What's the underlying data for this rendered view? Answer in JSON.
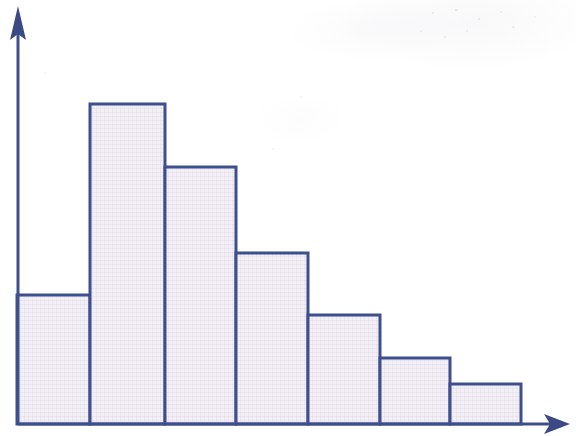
{
  "figure": {
    "title": "",
    "background_color": "#ffffff",
    "width": 576,
    "height": 436
  },
  "axes": {
    "y_axis": {
      "label": "",
      "color": "#3e4f8e",
      "arrow": "up-arrow",
      "line_width": 3,
      "x": 18,
      "top_y": 8,
      "bottom_y": 425,
      "tick_labels": []
    },
    "x_axis": {
      "label": "",
      "color": "#3e4f8e",
      "arrow": "right-arrow",
      "line_width": 3,
      "y": 424,
      "left_x": 18,
      "right_x": 568,
      "tick_labels": []
    }
  },
  "style": {
    "bar_edge_color": "#3e4f8e",
    "bar_fill_color": "#efecf3",
    "bar_hatch": "crosshatch",
    "bar_edge_width": 3,
    "baseline_y": 424
  },
  "chart_data": {
    "type": "bar",
    "title": "",
    "subtitle": "",
    "xlabel": "",
    "ylabel": "",
    "grid": false,
    "legend": null,
    "legend_position": "none",
    "annotations": [],
    "categories": [
      "1",
      "2",
      "3",
      "4",
      "5",
      "6",
      "7"
    ],
    "tick_labels": [],
    "values": [
      129,
      320,
      257,
      171,
      109,
      66,
      40
    ],
    "bar_left_edges": [
      17,
      90,
      165,
      236,
      308,
      380,
      450
    ],
    "bar_right_edges": [
      90,
      165,
      236,
      308,
      380,
      450,
      521
    ],
    "bar_top_y": [
      295,
      104,
      167,
      253,
      315,
      358,
      384
    ],
    "xlim": [
      17,
      521
    ],
    "ylim": [
      0,
      416
    ]
  }
}
